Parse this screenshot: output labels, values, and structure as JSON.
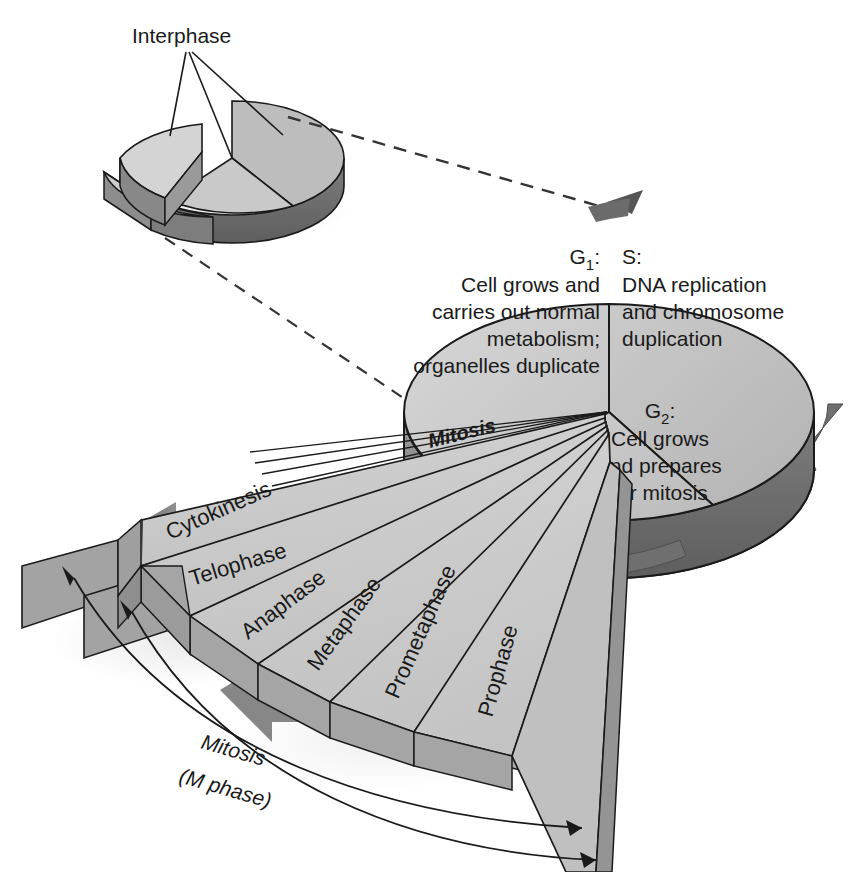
{
  "figure": {
    "type": "diagram"
  },
  "inset": {
    "label": "Interphase",
    "sectors": [
      "G1",
      "S",
      "G2"
    ]
  },
  "main_pie": {
    "sectors": [
      {
        "key": "g1",
        "heading": "G",
        "subscript": "1",
        "colon": ":",
        "lines": [
          "Cell grows and",
          "carries out normal",
          "metabolism;",
          "organelles duplicate"
        ]
      },
      {
        "key": "s",
        "heading": "S",
        "subscript": "",
        "colon": ":",
        "lines": [
          "DNA replication",
          "and chromosome",
          "duplication"
        ]
      },
      {
        "key": "g2",
        "heading": "G",
        "subscript": "2",
        "colon": ":",
        "lines": [
          "Cell grows",
          "and prepares",
          "for mitosis"
        ]
      }
    ],
    "mitosis_wedge_label": "Mitosis"
  },
  "fan": {
    "phases": [
      "Cytokinesis",
      "Telophase",
      "Anaphase",
      "Metaphase",
      "Prometaphase",
      "Prophase"
    ]
  },
  "bracket": {
    "line1": "Mitosis",
    "line2": "(M phase)"
  },
  "colors": {
    "face_light": "#d2d2d2",
    "face_mid": "#c0c0c0",
    "face_dark": "#a8a8a8",
    "rim_dark": "#8a8a8a",
    "rim_darker": "#6f6f6f",
    "arrow_gray": "#7d7d7d",
    "outline": "#1a1a1a",
    "text": "#1a1a1a",
    "background": "#ffffff"
  }
}
